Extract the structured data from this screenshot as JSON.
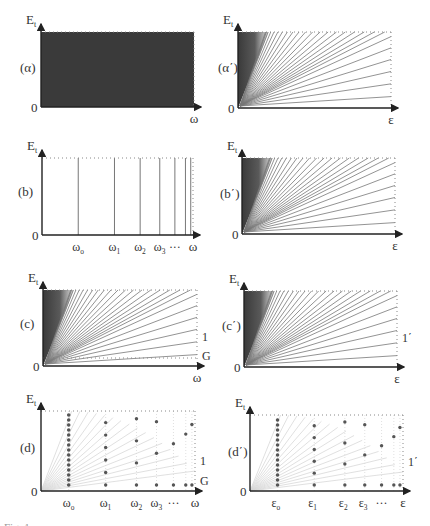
{
  "figure": {
    "panels": [
      {
        "id": "alpha",
        "label": "(α)",
        "y_axis": "E",
        "y_sub": "t",
        "x_axis": "ω",
        "origin": "0",
        "type": "filled-region"
      },
      {
        "id": "alpha_prime",
        "label": "(α΄)",
        "y_axis": "E",
        "y_sub": "t",
        "x_axis": "ε",
        "origin": "0",
        "type": "fan-lines"
      },
      {
        "id": "b",
        "label": "(b)",
        "y_axis": "E",
        "y_sub": "t",
        "x_axis": "ω",
        "origin": "0",
        "type": "vertical-lines",
        "x_ticks": [
          "ω",
          "ω",
          "ω",
          "ω",
          "···"
        ],
        "x_tick_subs": [
          "o",
          "1",
          "2",
          "3",
          ""
        ]
      },
      {
        "id": "b_prime",
        "label": "(b΄)",
        "y_axis": "E",
        "y_sub": "t",
        "x_axis": "ε",
        "origin": "0",
        "type": "fan-lines"
      },
      {
        "id": "c",
        "label": "(c)",
        "y_axis": "E",
        "y_sub": "t",
        "x_axis": "ω",
        "origin": "0",
        "type": "fan-lines",
        "right_labels": [
          "1",
          "G"
        ]
      },
      {
        "id": "c_prime",
        "label": "(c΄)",
        "y_axis": "E",
        "y_sub": "t",
        "x_axis": "ε",
        "origin": "0",
        "type": "fan-lines",
        "right_labels": [
          "1΄"
        ]
      },
      {
        "id": "d",
        "label": "(d)",
        "y_axis": "E",
        "y_sub": "t",
        "x_axis": "ω",
        "origin": "0",
        "type": "dot-grid",
        "right_labels": [
          "1",
          "G"
        ],
        "x_ticks": [
          "ω",
          "ω",
          "ω",
          "ω",
          "···"
        ],
        "x_tick_subs": [
          "o",
          "1",
          "2",
          "3",
          ""
        ]
      },
      {
        "id": "d_prime",
        "label": "(d΄)",
        "y_axis": "E",
        "y_sub": "t",
        "x_axis": "ε",
        "origin": "0",
        "type": "dot-grid",
        "right_labels": [
          "1΄"
        ],
        "x_ticks": [
          "ε",
          "ε",
          "ε",
          "ε",
          "···"
        ],
        "x_tick_subs": [
          "o",
          "1",
          "2",
          "3",
          ""
        ]
      }
    ],
    "caption": "Fig. 1"
  },
  "colors": {
    "axis": "#222222",
    "fill": "#3a3a3a",
    "line": "#777777",
    "dotted": "#888888",
    "dot": "#555555",
    "faint": "#d8d8d8"
  }
}
